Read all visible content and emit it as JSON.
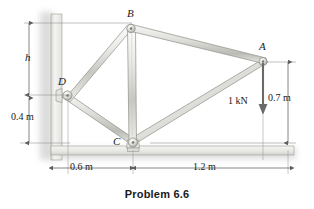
{
  "figure": {
    "caption": "Problem 6.6",
    "type": "statics-truss-diagram",
    "colors": {
      "member_light": "#f2f2f0",
      "member_mid": "#cfcfca",
      "member_dark": "#a8a8a2",
      "outline": "#8a8a85",
      "wall_light": "#f0f0ee",
      "wall_shadow": "#cccccc",
      "dimension_line": "#6f6f6f",
      "text": "#1a1a1a",
      "background": "#ffffff"
    }
  },
  "joints": [
    {
      "id": "B",
      "label": "B",
      "x": 131,
      "y": 28
    },
    {
      "id": "A",
      "label": "A",
      "x": 263,
      "y": 62
    },
    {
      "id": "D",
      "label": "D",
      "x": 68,
      "y": 95
    },
    {
      "id": "C",
      "label": "C",
      "x": 133,
      "y": 143
    }
  ],
  "members": [
    {
      "name": "member-DB",
      "from": "D",
      "to": "B"
    },
    {
      "name": "member-BA",
      "from": "B",
      "to": "A"
    },
    {
      "name": "member-BC",
      "from": "B",
      "to": "C"
    },
    {
      "name": "member-DC",
      "from": "D",
      "to": "C"
    },
    {
      "name": "member-CA",
      "from": "C",
      "to": "A"
    }
  ],
  "supports": [
    {
      "name": "wall-pin-support-D",
      "joint": "D",
      "kind": "wall-pin"
    },
    {
      "name": "ground-pin-support-C",
      "joint": "C",
      "kind": "ground-pin"
    }
  ],
  "load": {
    "label": "1 kN",
    "value": 1,
    "unit": "kN",
    "direction": "down",
    "applied_at": "A"
  },
  "dimensions": [
    {
      "name": "dim-h",
      "label": "h",
      "orientation": "vertical",
      "side": "left",
      "from_y": 23,
      "to_y": 95
    },
    {
      "name": "dim-0.4m",
      "label": "0.4 m",
      "orientation": "vertical",
      "side": "left",
      "from_y": 95,
      "to_y": 143
    },
    {
      "name": "dim-0.7m",
      "label": "0.7 m",
      "orientation": "vertical",
      "side": "right",
      "from_y": 62,
      "to_y": 143
    },
    {
      "name": "dim-0.6m",
      "label": "0.6 m",
      "orientation": "horizontal",
      "side": "bottom",
      "from_x": 68,
      "to_x": 133
    },
    {
      "name": "dim-1.2m",
      "label": "1.2 m",
      "orientation": "horizontal",
      "side": "bottom",
      "from_x": 133,
      "to_x": 288
    }
  ]
}
